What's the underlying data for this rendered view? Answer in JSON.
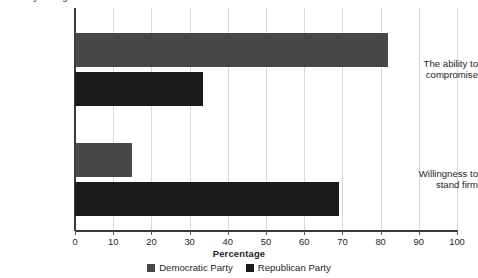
{
  "chart_data": {
    "type": "bar",
    "orientation": "horizontal",
    "title": "",
    "xlabel": "Percentage",
    "ylabel": "",
    "xlim": [
      0,
      100
    ],
    "grid": true,
    "legend_position": "bottom",
    "categories": [
      "The ability to compromise",
      "Willingness to stand firm"
    ],
    "category_lines": [
      [
        "The ability to",
        "compromise"
      ],
      [
        "Willingness to",
        "stand firm"
      ]
    ],
    "series": [
      {
        "name": "Democratic Party",
        "color": "#474747",
        "values": [
          82,
          15
        ]
      },
      {
        "name": "Republican Party",
        "color": "#1a1a1a",
        "values": [
          33.5,
          69
        ]
      }
    ],
    "xticks": [
      0,
      10,
      20,
      30,
      40,
      50,
      60,
      70,
      80,
      90,
      100
    ]
  },
  "clipped_header": {
    "text": "Survey of registered voters"
  },
  "legend": {
    "items": [
      {
        "label": "Democratic Party",
        "color": "#474747"
      },
      {
        "label": "Republican Party",
        "color": "#1a1a1a"
      }
    ]
  },
  "axis": {
    "x_title": "Percentage"
  }
}
